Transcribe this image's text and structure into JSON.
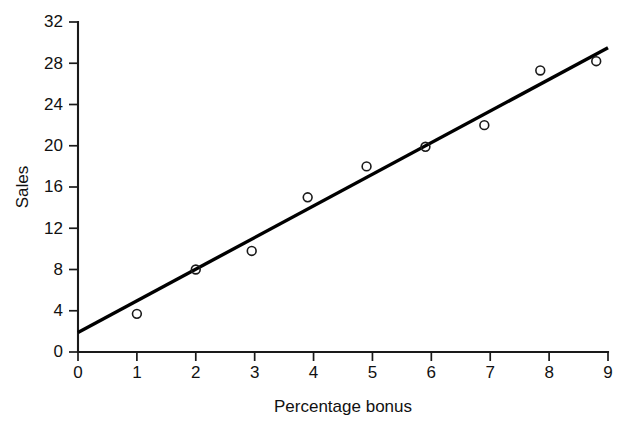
{
  "figure": {
    "background_color": "#ffffff",
    "ink_color": "#1a1a1a",
    "top_bleed_text": "",
    "xlabel": "Percentage bonus",
    "ylabel": "Sales"
  },
  "chart_data": {
    "type": "scatter",
    "title": "",
    "xlabel": "Percentage bonus",
    "ylabel": "Sales",
    "xlim": [
      0,
      9
    ],
    "ylim": [
      0,
      32
    ],
    "xticks": [
      0,
      1,
      2,
      3,
      4,
      5,
      6,
      7,
      8,
      9
    ],
    "yticks": [
      0,
      4,
      8,
      12,
      16,
      20,
      24,
      28,
      32
    ],
    "xtick_labels": [
      "0",
      "1",
      "2",
      "3",
      "4",
      "5",
      "6",
      "7",
      "8",
      "9"
    ],
    "ytick_labels": [
      "0",
      "4",
      "8",
      "12",
      "16",
      "20",
      "24",
      "28",
      "32"
    ],
    "grid": false,
    "legend": false,
    "legend_position": "none",
    "marker_style": "open-circle",
    "points": [
      {
        "x": 1.0,
        "y": 3.7
      },
      {
        "x": 2.0,
        "y": 8.0
      },
      {
        "x": 2.95,
        "y": 9.8
      },
      {
        "x": 3.9,
        "y": 15.0
      },
      {
        "x": 4.9,
        "y": 18.0
      },
      {
        "x": 5.9,
        "y": 19.9
      },
      {
        "x": 6.9,
        "y": 22.0
      },
      {
        "x": 7.85,
        "y": 27.3
      },
      {
        "x": 8.8,
        "y": 28.2
      }
    ],
    "x": [
      1.0,
      2.0,
      2.95,
      3.9,
      4.9,
      5.9,
      6.9,
      7.85,
      8.8
    ],
    "values": [
      3.7,
      8.0,
      9.8,
      15.0,
      18.0,
      19.9,
      22.0,
      27.3,
      28.2
    ],
    "series": [
      {
        "name": "Sales",
        "marker": "open-circle",
        "values": [
          3.7,
          8.0,
          9.8,
          15.0,
          18.0,
          19.9,
          22.0,
          27.3,
          28.2
        ]
      }
    ],
    "trendline": {
      "type": "linear-fit",
      "x_start": 0.0,
      "y_start": 1.9,
      "x_end": 9.0,
      "y_end": 29.5,
      "intercept": 1.9,
      "slope": 3.07
    }
  }
}
